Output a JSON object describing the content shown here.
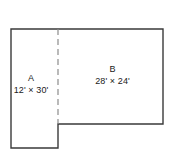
{
  "diagram": {
    "type": "floor-plan",
    "title": "",
    "background_color": "#ffffff",
    "outline_color": "#3a3a3a",
    "divider_color": "#8c8c8c",
    "text_color": "#1a1a1a",
    "shape": "L-shaped region split by a vertical dashed line into two labeled rectangular areas",
    "regions": [
      {
        "id": "region-a",
        "name": "A",
        "dimensions": "12' × 30'",
        "width_ft": 12,
        "length_ft": 30
      },
      {
        "id": "region-b",
        "name": "B",
        "dimensions": "28' × 24'",
        "width_ft": 28,
        "length_ft": 24
      }
    ],
    "outline_path": "M11,29 L163,29 L163,124 L58,124 L58,148 L11,148 Z",
    "divider_path": "M58,29 L58,124"
  }
}
